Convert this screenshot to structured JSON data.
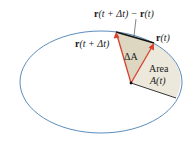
{
  "diagram": {
    "type": "kepler-second-law-area-sweep",
    "colors": {
      "ellipse": "#4a7fb5",
      "vector": "#d9412f",
      "chord": "#111111",
      "sector_area": "#ece9dc",
      "delta_sector": "#ddd7c2",
      "background": "#ffffff"
    },
    "labels": {
      "diff_bold": "r",
      "diff_rest": "(t + Δt) − ",
      "diff_bold2": "r",
      "diff_tail": "(t)",
      "r_t_bold": "r",
      "r_t_rest": "(t)",
      "r_tdt_bold": "r",
      "r_tdt_rest": "(t + Δt)",
      "delta_a": "ΔA",
      "area_word": "Area",
      "area_func": "A(t)"
    }
  }
}
